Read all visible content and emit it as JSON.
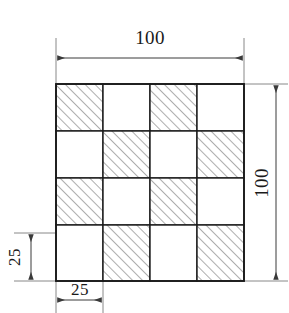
{
  "figure": {
    "type": "engineering-drawing",
    "background_color": "#ffffff",
    "line_color": "#1a1a1a",
    "dimension_line_color": "#555555",
    "hatch_color": "#666666"
  },
  "geometry": {
    "grid_rows": 4,
    "grid_cols": 4,
    "cell_size_units": 25,
    "overall_size_units": 100,
    "origin_x_px": 56,
    "origin_y_px": 84,
    "cell_px": 47,
    "hatch_angle_deg": 45,
    "hatch_spacing_px": 7,
    "pattern_note": "checkerboard, top-left cell hatched",
    "cells": [
      [
        true,
        false,
        true,
        false
      ],
      [
        false,
        true,
        false,
        true
      ],
      [
        true,
        false,
        true,
        false
      ],
      [
        false,
        true,
        false,
        true
      ]
    ]
  },
  "dimensions": {
    "top": {
      "label": "100",
      "orientation": "horizontal",
      "spans": "full width"
    },
    "right": {
      "label": "100",
      "orientation": "vertical",
      "rotated": true,
      "spans": "full height"
    },
    "left": {
      "label": "25",
      "orientation": "vertical",
      "rotated": true,
      "spans": "bottom row height"
    },
    "bottom": {
      "label": "25",
      "orientation": "horizontal",
      "spans": "first column width"
    }
  }
}
